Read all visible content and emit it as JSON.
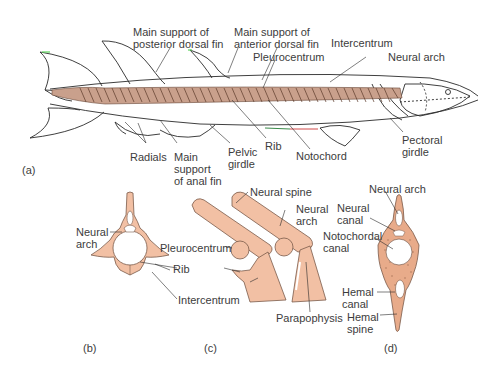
{
  "figure": {
    "colors": {
      "bone": "#f2c0a4",
      "bone_stroke": "#7a5a4a",
      "line": "#2a2a2a",
      "vertebra_dark": "#8a6a5a"
    },
    "panel_a": {
      "label": "(a)",
      "labels": {
        "post_dorsal": [
          "Main support of",
          "posterior dorsal fin"
        ],
        "ant_dorsal": [
          "Main support of",
          "anterior dorsal fin"
        ],
        "intercentrum": "Intercentrum",
        "neural_arch": "Neural arch",
        "pleurocentrum": "Pleurocentrum",
        "radials": "Radials",
        "anal_fin": [
          "Main",
          "support",
          "of anal fin"
        ],
        "pelvic": [
          "Pelvic",
          "girdle"
        ],
        "rib": "Rib",
        "notochord": "Notochord",
        "pectoral": [
          "Pectoral",
          "girdle"
        ]
      }
    },
    "panel_b": {
      "label": "(b)",
      "labels": {
        "neural_arch": [
          "Neural",
          "arch"
        ],
        "rib": "Rib",
        "intercentrum": "Intercentrum"
      }
    },
    "panel_c": {
      "label": "(c)",
      "labels": {
        "neural_spine": "Neural spine",
        "neural_arch": [
          "Neural",
          "arch"
        ],
        "pleurocentrum": "Pleurocentrum",
        "parapophysis": "Parapophysis"
      }
    },
    "panel_d": {
      "label": "(d)",
      "labels": {
        "neural_arch": "Neural arch",
        "neural_canal": [
          "Neural",
          "canal"
        ],
        "notochordal_canal": [
          "Notochordal",
          "canal"
        ],
        "hemal_canal": [
          "Hemal",
          "canal"
        ],
        "hemal_spine": [
          "Hemal",
          "spine"
        ]
      }
    }
  }
}
